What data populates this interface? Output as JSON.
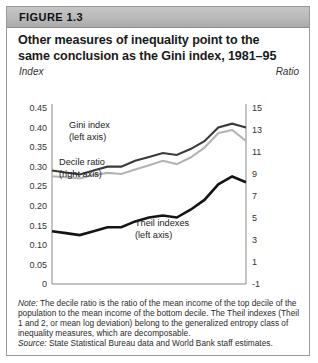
{
  "figure": {
    "label": "FIGURE 1.3",
    "title": "Other measures of inequality point to the same conclusion as the Gini index, 1981–95",
    "title_line1": "Other measures of inequality point to the",
    "title_line2": "same conclusion as the Gini index, 1981–95",
    "axis_label_left": "Index",
    "axis_label_right": "Ratio",
    "note_label": "Note:",
    "note_text": " The decile ratio is the ratio of the mean income of the top decile of the population to the mean income of the bottom decile. The Theil indexes (Theil 1 and 2, or mean log deviation) belong to the generalized entropy class of inequality measures, which are decomposable.",
    "source_label": "Source:",
    "source_text": " State Statistical Bureau data and World Bank staff estimates."
  },
  "chart_data": {
    "type": "line",
    "title": "Other measures of inequality point to the same conclusion as the Gini index, 1981–95",
    "xlabel": "",
    "ylabel": "Index",
    "ylabel_right": "Ratio",
    "x": [
      1981,
      1982,
      1983,
      1984,
      1985,
      1986,
      1987,
      1988,
      1989,
      1990,
      1991,
      1992,
      1993,
      1994,
      1995
    ],
    "xtick_labels": [
      "1981",
      "1983",
      "1985",
      "1987",
      "1989",
      "1991",
      "1993",
      "1995"
    ],
    "xtick_values": [
      1981,
      1983,
      1985,
      1987,
      1989,
      1991,
      1993,
      1995
    ],
    "xlim": [
      1981,
      1995
    ],
    "ylim": [
      0,
      0.45
    ],
    "ytick_labels": [
      "0.45",
      "0.40",
      "0.35",
      "0.30",
      "0.25",
      "0.20",
      "0.15",
      "0.10",
      "0.05",
      "0"
    ],
    "ytick_values": [
      0.45,
      0.4,
      0.35,
      0.3,
      0.25,
      0.2,
      0.15,
      0.1,
      0.05,
      0
    ],
    "ylim_right": [
      -1,
      15
    ],
    "ytick_labels_right": [
      "15",
      "13",
      "11",
      "9",
      "7",
      "5",
      "3",
      "1",
      "-1"
    ],
    "ytick_values_right": [
      15,
      13,
      11,
      9,
      7,
      5,
      3,
      1,
      -1
    ],
    "grid": false,
    "legend_position": "inline-annotations",
    "series": [
      {
        "name": "Gini index",
        "annotation": "Gini index",
        "annotation_sub": "(left axis)",
        "axis": "left",
        "color": "#3a3a3a",
        "values": [
          0.29,
          0.285,
          0.28,
          0.29,
          0.3,
          0.3,
          0.315,
          0.325,
          0.335,
          0.33,
          0.345,
          0.365,
          0.4,
          0.41,
          0.4
        ]
      },
      {
        "name": "Decile ratio",
        "annotation": "Decile ratio",
        "annotation_sub": "(right axis)",
        "axis": "right",
        "color": "#b4b4b4",
        "values": [
          8.8,
          8.7,
          8.6,
          8.9,
          9.1,
          9.0,
          9.4,
          9.8,
          10.2,
          9.9,
          10.5,
          11.4,
          12.7,
          13.0,
          12.0
        ]
      },
      {
        "name": "Theil indexes",
        "annotation": "Theil indexes",
        "annotation_sub": "(left axis)",
        "axis": "left",
        "color": "#141414",
        "values": [
          0.135,
          0.13,
          0.125,
          0.135,
          0.145,
          0.145,
          0.16,
          0.17,
          0.175,
          0.17,
          0.19,
          0.215,
          0.255,
          0.275,
          0.26
        ]
      }
    ]
  }
}
